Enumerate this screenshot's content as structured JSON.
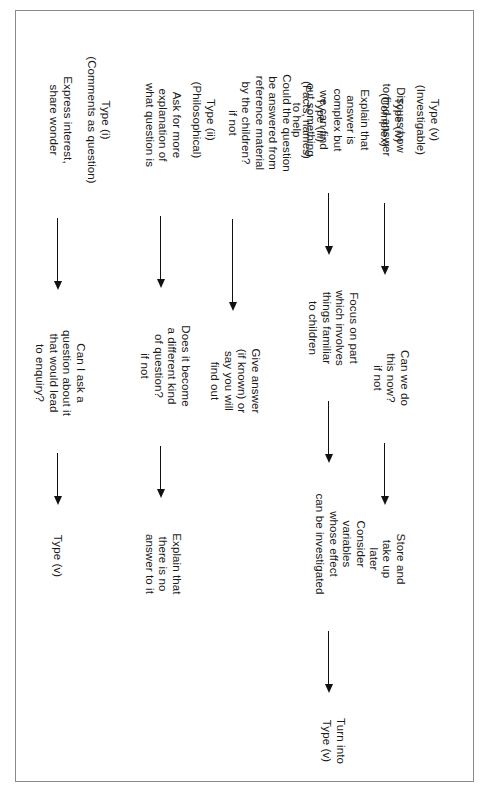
{
  "diagram": {
    "type": "flowchart",
    "orientation": "rotated-90-clockwise",
    "line_color": "#111111",
    "border_color": "#8a8a8a",
    "columns": [
      {
        "id": "type-i",
        "header": "Type (i)\n(Comments as question)",
        "nodes": [
          {
            "id": "i-1",
            "text": "Express interest,\nshare wonder"
          },
          {
            "id": "i-2",
            "text": "Can I ask a\nquestion about it\nthat would lead\nto enquiry?"
          },
          {
            "id": "i-3",
            "text": "Type (v)"
          }
        ],
        "arrows": [
          {
            "id": "i-a1",
            "from": "i-1",
            "to": "i-2"
          },
          {
            "id": "i-a2",
            "from": "i-2",
            "to": "i-3"
          }
        ]
      },
      {
        "id": "type-ii",
        "header": "Type (ii)\n(Philosophical)",
        "nodes": [
          {
            "id": "ii-1",
            "text": "Ask for more\nexplanation of\nwhat question is"
          },
          {
            "id": "ii-2",
            "text": "Does it become\na different kind\nof question?\nif not"
          },
          {
            "id": "ii-3",
            "text": "Explain that\nthere is no\nanswer to it"
          }
        ],
        "arrows": [
          {
            "id": "ii-a1",
            "from": "ii-1",
            "to": "ii-2"
          },
          {
            "id": "ii-a2",
            "from": "ii-2",
            "to": "ii-3"
          }
        ]
      },
      {
        "id": "type-iii",
        "header": "Type (iii)\n(Facts, names)",
        "nodes": [
          {
            "id": "iii-1",
            "text": "Could the question\nbe answered from\nreference material\nby the children?\nif not"
          },
          {
            "id": "iii-2",
            "text": "Give answer\n(if known) or\nsay you will\nfind out"
          }
        ],
        "arrows": [
          {
            "id": "iii-a1",
            "from": "iii-1",
            "to": "iii-2"
          }
        ]
      },
      {
        "id": "type-iv",
        "header": "Type (iv)\n(Complex)",
        "nodes": [
          {
            "id": "iv-1",
            "text": "Explain that\nanswer is\ncomplex but\nwe can find\nout something\nto help"
          },
          {
            "id": "iv-2",
            "text": "Focus on part\nwhich involves\nthings familiar\nto children"
          },
          {
            "id": "iv-3",
            "text": "Consider\nvariables\nwhose effect\ncan be investigated"
          },
          {
            "id": "iv-4",
            "text": "Turn into\nType (v)"
          }
        ],
        "arrows": [
          {
            "id": "iv-a1",
            "from": "iv-1",
            "to": "iv-2"
          },
          {
            "id": "iv-a2",
            "from": "iv-2",
            "to": "iv-3"
          },
          {
            "id": "iv-a3",
            "from": "iv-3",
            "to": "iv-4"
          }
        ]
      },
      {
        "id": "type-v",
        "header": "Type (v)\n(Investigable)",
        "nodes": [
          {
            "id": "v-1",
            "text": "Discuss how\nto find answer"
          },
          {
            "id": "v-2",
            "text": "Can we do\nthis now?\nif not"
          },
          {
            "id": "v-3",
            "text": "Store and\ntake up\nlater"
          }
        ],
        "arrows": [
          {
            "id": "v-a1",
            "from": "v-1",
            "to": "v-2"
          },
          {
            "id": "v-a2",
            "from": "v-2",
            "to": "v-3"
          }
        ]
      }
    ]
  }
}
